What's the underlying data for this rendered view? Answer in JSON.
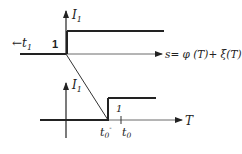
{
  "top_plot": {
    "y_axis_label": "I",
    "y_axis_subscript": "1",
    "step_level_label": "1",
    "left_label_arrow": "←",
    "left_label": "t",
    "left_label_subscript": "1",
    "x_axis_label": "s= φ (T)+ ξ(T)"
  },
  "bottom_plot": {
    "y_axis_label": "I",
    "y_axis_subscript": "1",
    "step_level_label": "1",
    "x_axis_label": "T",
    "tick_1_label": "t",
    "tick_1_subscript": "0",
    "tick_1_superscript": "-",
    "tick_2_label": "t",
    "tick_2_subscript": "0"
  },
  "colors": {
    "line": "#222222",
    "axis": "#333333",
    "background": "#ffffff"
  }
}
